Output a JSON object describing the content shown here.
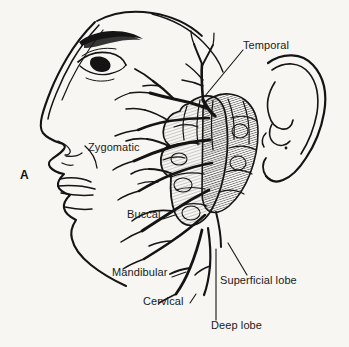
{
  "figure": {
    "panel_letter": "A",
    "background_color": "#f7f6f2",
    "ink_color": "#141414"
  },
  "labels": {
    "temporal": "Temporal",
    "zygomatic": "Zygomatic",
    "buccal": "Buccal",
    "mandibular": "Mandibular",
    "cervical": "Cervical",
    "superficial_lobe": "Superficial lobe",
    "deep_lobe": "Deep lobe"
  },
  "structures": {
    "ear": "ear-auricle",
    "eye": "eye",
    "eyebrow": "eyebrow",
    "nose": "nose-profile",
    "lips": "lips",
    "chin": "chin",
    "jawline": "mandible-outline",
    "parotid_gland": "parotid-gland",
    "facial_nerve": "facial-nerve-branches"
  }
}
